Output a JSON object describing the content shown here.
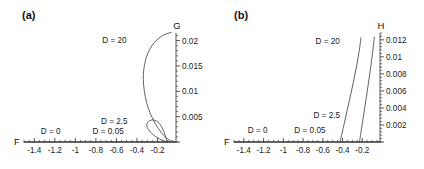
{
  "figure": {
    "panels": [
      {
        "id": "a",
        "label": "(a)",
        "xaxis_name": "F",
        "yaxis_name": "G",
        "xticks": [
          "-1.4",
          "-1.2",
          "-1",
          "-0.8",
          "-0.6",
          "-0.4",
          "-0.2"
        ],
        "yticks": [
          "0.005",
          "0.01",
          "0.015",
          "0.02"
        ],
        "curve_labels": [
          "D = 0",
          "D = 0.05",
          "D = 2.5",
          "D = 20"
        ]
      },
      {
        "id": "b",
        "label": "(b)",
        "xaxis_name": "F",
        "yaxis_name": "H",
        "xticks": [
          "-1.4",
          "-1.2",
          "-1",
          "-0.8",
          "-0.6",
          "-0.4",
          "-0.2"
        ],
        "yticks": [
          "0.002",
          "0.004",
          "0.006",
          "0.008",
          "0.01",
          "0.012"
        ],
        "curve_labels": [
          "D = 0",
          "D = 0.05",
          "D = 2.5",
          "D = 20"
        ]
      }
    ]
  },
  "chart_data": [
    {
      "type": "line",
      "panel": "a",
      "title": "(a)",
      "xlabel": "F",
      "ylabel": "G",
      "xlim": [
        -1.5,
        -0.02
      ],
      "ylim": [
        0,
        0.0215
      ],
      "xticks": [
        -1.4,
        -1.2,
        -1.0,
        -0.8,
        -0.6,
        -0.4,
        -0.2
      ],
      "xticklabels": [
        "-1.4",
        "-1.2",
        "-1",
        "-0.8",
        "-0.6",
        "-0.4",
        "-0.2"
      ],
      "yticks": [
        0.005,
        0.01,
        0.015,
        0.02
      ],
      "yticklabels": [
        "0.005",
        "0.01",
        "0.015",
        "0.02"
      ],
      "grid": false,
      "legend": "inline-annotations",
      "series": [
        {
          "name": "D = 0",
          "annotation": "D = 0",
          "annotation_xy": [
            -1.24,
            0.0016
          ],
          "points": [
            [
              -1.5,
              0.0
            ],
            [
              -0.02,
              0.0
            ]
          ]
        },
        {
          "name": "D = 0.05",
          "annotation": "D = 0.05",
          "annotation_xy": [
            -0.68,
            0.0016
          ],
          "points": [
            [
              -1.5,
              0.0
            ],
            [
              -0.02,
              0.0
            ]
          ]
        },
        {
          "name": "D = 2.5",
          "annotation": "D = 2.5",
          "annotation_xy": [
            -0.62,
            0.0035
          ],
          "points": [
            [
              -0.1,
              0.0
            ],
            [
              -0.155,
              0.00035
            ],
            [
              -0.205,
              0.0009
            ],
            [
              -0.255,
              0.00165
            ],
            [
              -0.29,
              0.0025
            ],
            [
              -0.305,
              0.0032
            ],
            [
              -0.3,
              0.0038
            ],
            [
              -0.278,
              0.0042
            ],
            [
              -0.248,
              0.00435
            ],
            [
              -0.215,
              0.0042
            ],
            [
              -0.185,
              0.0037
            ],
            [
              -0.16,
              0.003
            ],
            [
              -0.14,
              0.00215
            ],
            [
              -0.125,
              0.0013
            ],
            [
              -0.115,
              0.0006
            ],
            [
              -0.108,
              0.00015
            ],
            [
              -0.105,
              0.0
            ]
          ]
        },
        {
          "name": "D = 20",
          "annotation": "D = 20",
          "annotation_xy": [
            -0.62,
            0.0196
          ],
          "points": [
            [
              -0.045,
              0.0
            ],
            [
              -0.09,
              0.00045
            ],
            [
              -0.14,
              0.0013
            ],
            [
              -0.19,
              0.0026
            ],
            [
              -0.24,
              0.0043
            ],
            [
              -0.285,
              0.0064
            ],
            [
              -0.318,
              0.0088
            ],
            [
              -0.335,
              0.0112
            ],
            [
              -0.338,
              0.0133
            ],
            [
              -0.327,
              0.0152
            ],
            [
              -0.305,
              0.0169
            ],
            [
              -0.272,
              0.0184
            ],
            [
              -0.232,
              0.0196
            ],
            [
              -0.186,
              0.0205
            ],
            [
              -0.14,
              0.0211
            ],
            [
              -0.098,
              0.02145
            ],
            [
              -0.068,
              0.0216
            ]
          ]
        }
      ]
    },
    {
      "type": "line",
      "panel": "b",
      "title": "(b)",
      "xlabel": "F",
      "ylabel": "H",
      "xlim": [
        -1.5,
        -0.02
      ],
      "ylim": [
        0,
        0.0128
      ],
      "xticks": [
        -1.4,
        -1.2,
        -1.0,
        -0.8,
        -0.6,
        -0.4,
        -0.2
      ],
      "xticklabels": [
        "-1.4",
        "-1.2",
        "-1",
        "-0.8",
        "-0.6",
        "-0.4",
        "-0.2"
      ],
      "yticks": [
        0.002,
        0.004,
        0.006,
        0.008,
        0.01,
        0.012
      ],
      "yticklabels": [
        "0.002",
        "0.004",
        "0.006",
        "0.008",
        "0.01",
        "0.012"
      ],
      "grid": false,
      "legend": "inline-annotations",
      "series": [
        {
          "name": "D = 0",
          "annotation": "D = 0",
          "annotation_xy": [
            -1.26,
            0.001
          ],
          "points": [
            [
              -1.5,
              0.0
            ],
            [
              -0.02,
              0.0
            ]
          ]
        },
        {
          "name": "D = 0.05",
          "annotation": "D = 0.05",
          "annotation_xy": [
            -0.73,
            0.001
          ],
          "points": [
            [
              -1.5,
              0.0
            ],
            [
              -0.02,
              0.0
            ]
          ]
        },
        {
          "name": "D = 2.5",
          "annotation": "D = 2.5",
          "annotation_xy": [
            -0.56,
            0.0028
          ],
          "points": [
            [
              -0.425,
              0.0
            ],
            [
              -0.39,
              0.0018
            ],
            [
              -0.355,
              0.0036
            ],
            [
              -0.32,
              0.0054
            ],
            [
              -0.288,
              0.00715
            ],
            [
              -0.258,
              0.0089
            ],
            [
              -0.232,
              0.0106
            ],
            [
              -0.212,
              0.01225
            ]
          ]
        },
        {
          "name": "D = 20",
          "annotation": "D = 20",
          "annotation_xy": [
            -0.55,
            0.01155
          ],
          "points": [
            [
              -0.228,
              0.0
            ],
            [
              -0.205,
              0.00175
            ],
            [
              -0.182,
              0.0035
            ],
            [
              -0.158,
              0.0053
            ],
            [
              -0.135,
              0.0071
            ],
            [
              -0.113,
              0.0089
            ],
            [
              -0.094,
              0.0106
            ],
            [
              -0.078,
              0.0123
            ]
          ]
        }
      ]
    }
  ]
}
